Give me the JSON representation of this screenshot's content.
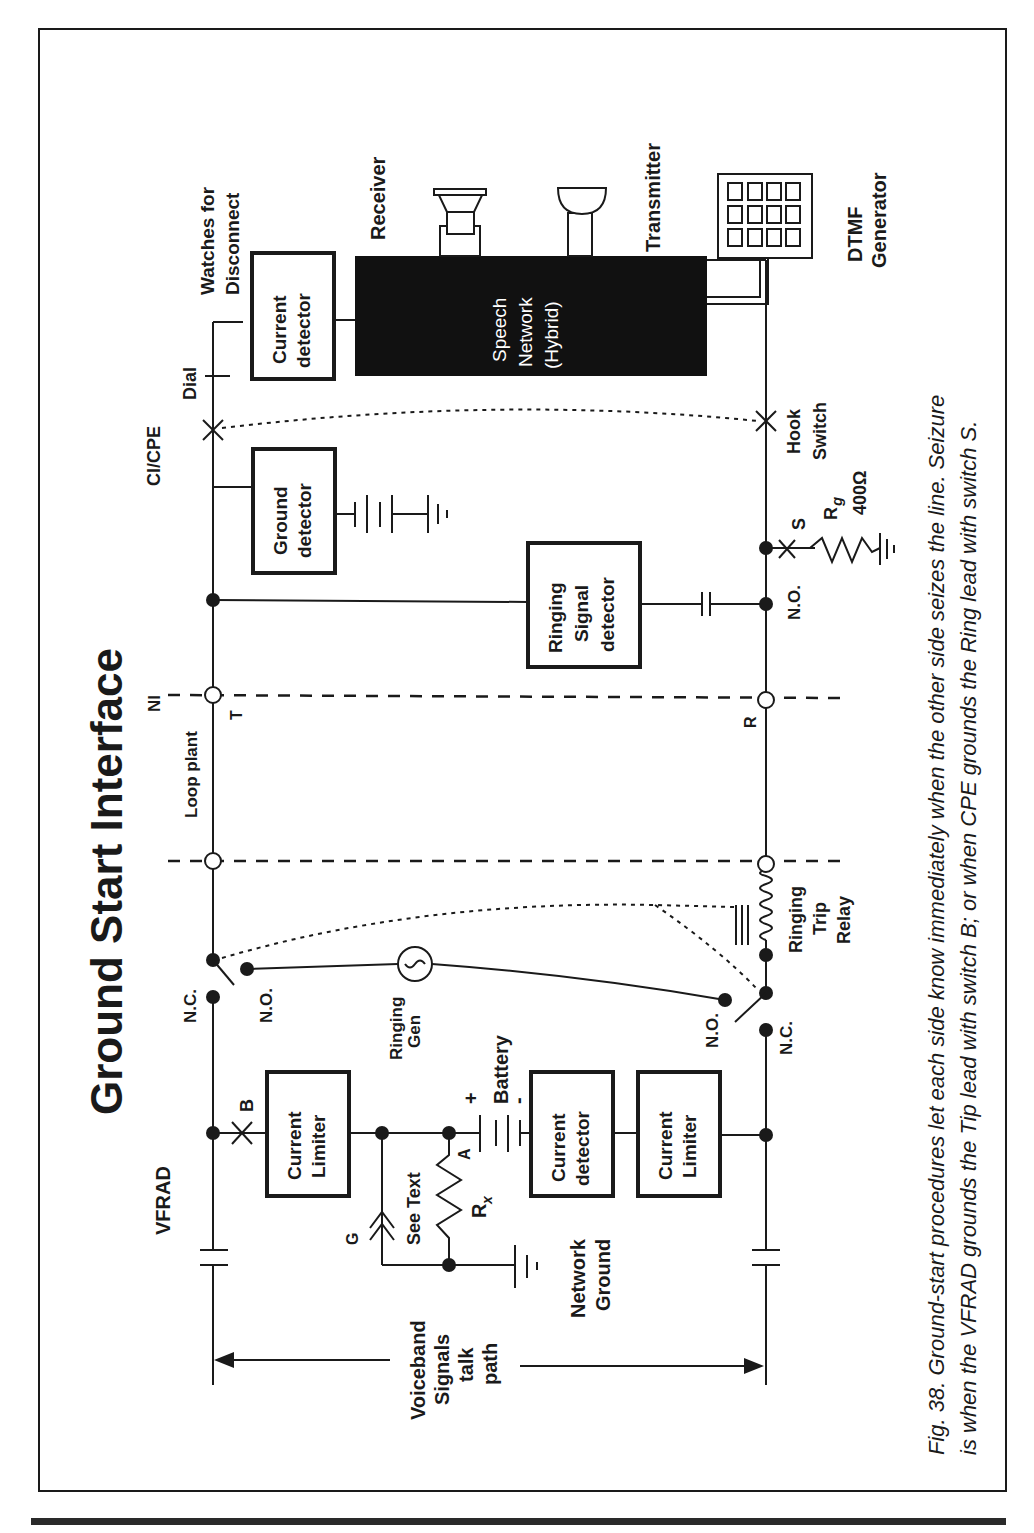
{
  "figure": {
    "title": "Ground Start Interface",
    "caption_line1": "Fig. 38.  Ground-start procedures let each side know immediately when the other side seizes the line.  Seizure",
    "caption_line2": "is when the VFRAD grounds the Tip lead with switch B; or when CPE grounds the Ring lead with switch S."
  },
  "sections": {
    "vfrad": "VFRAD",
    "loop_plant": "Loop plant",
    "ni": "NI",
    "ci_cpe": "CI/CPE"
  },
  "leads": {
    "tip": "T",
    "ring": "R"
  },
  "components": {
    "current_limiter_tip": [
      "Current",
      "Limiter"
    ],
    "current_detector_net": [
      "Current",
      "detector"
    ],
    "current_limiter_ring": [
      "Current",
      "Limiter"
    ],
    "battery": "Battery",
    "battery_plus": "+",
    "battery_minus": "-",
    "rx_label": "R",
    "rx_sub": "x",
    "node_a": "A",
    "see_text": "See Text",
    "g_label": "G",
    "network_ground": [
      "Network",
      "Ground"
    ],
    "ringing_gen": [
      "Ringing",
      "Gen"
    ],
    "ringing_trip_relay": [
      "Ringing",
      "Trip",
      "Relay"
    ],
    "ground_detector": [
      "Ground",
      "detector"
    ],
    "ringing_signal_detector": [
      "Ringing",
      "Signal",
      "detector"
    ],
    "current_detector_cpe": [
      "Current",
      "detector"
    ],
    "watches_for_disconnect": [
      "Watches for",
      "Disconnect"
    ],
    "speech_network": [
      "Speech",
      "Network",
      "(Hybrid)"
    ],
    "receiver": "Receiver",
    "transmitter": "Transmitter",
    "dtmf_generator": [
      "DTMF",
      "Generator"
    ],
    "dial": "Dial",
    "hook_switch": [
      "Hook",
      "Switch"
    ],
    "switch_b": "B",
    "switch_s": "S",
    "rg_label": "R",
    "rg_sub": "g",
    "rg_value": "400Ω",
    "nc_tip": "N.C.",
    "no_tip": "N.O.",
    "no_ring": "N.O.",
    "nc_ring": "N.C.",
    "no_cpe": "N.O."
  },
  "talk_path": [
    "Voiceband",
    "Signals",
    "talk",
    "path"
  ],
  "colors": {
    "ink": "#1a1a1a",
    "paper": "#ffffff"
  }
}
